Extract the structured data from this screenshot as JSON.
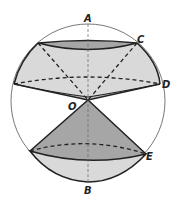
{
  "figure": {
    "type": "sphere-with-cones-diagram",
    "colors": {
      "background": "#ffffff",
      "outline": "#222222",
      "circle": "#555555",
      "light_fill": "#d9d9d9",
      "dark_fill": "#a6a6a6",
      "mid_fill": "#bdbdbd"
    },
    "labels": {
      "A": "A",
      "B": "B",
      "C": "C",
      "D": "D",
      "E": "E",
      "O": "O"
    }
  }
}
